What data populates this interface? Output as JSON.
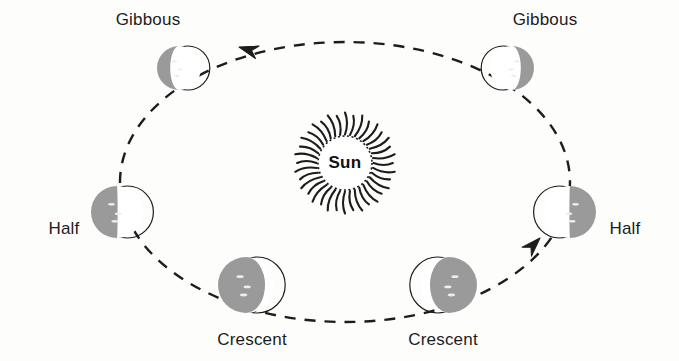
{
  "diagram": {
    "background_color": "#fdfdfc",
    "ink_color": "#1c1c1c",
    "shadow_color": "#9a9a9a",
    "lit_color": "#ffffff",
    "center_body": {
      "name": "Sun",
      "label": "Sun",
      "cx": 345,
      "cy": 163,
      "core_radius": 27,
      "ray_count": 36,
      "ray_length": 22
    },
    "orbit": {
      "cx": 345,
      "cy": 182,
      "rx": 225,
      "ry": 140,
      "style": "dashed",
      "dash": "11 9",
      "stroke_width": 2.4,
      "direction": "counterclockwise"
    },
    "arrows": [
      {
        "name": "orbit-arrow-top",
        "x": 239,
        "y": 47,
        "angle": 196,
        "description": "arrowhead pointing left along top of orbit"
      },
      {
        "name": "orbit-arrow-lower-right",
        "x": 540,
        "y": 238,
        "angle": -46,
        "description": "arrowhead pointing up-right toward right Half moon"
      }
    ],
    "moons": [
      {
        "id": "gibbous-left",
        "label": "Gibbous",
        "phase": "gibbous",
        "cx": 179,
        "cy": 68,
        "r": 22,
        "shadow_side": "left",
        "shadow_fraction": 0.3,
        "label_x": 148,
        "label_y": 25,
        "label_anchor": "middle"
      },
      {
        "id": "gibbous-right",
        "label": "Gibbous",
        "phase": "gibbous",
        "cx": 512,
        "cy": 68,
        "r": 22,
        "shadow_side": "right",
        "shadow_fraction": 0.3,
        "label_x": 545,
        "label_y": 25,
        "label_anchor": "middle"
      },
      {
        "id": "half-left",
        "label": "Half",
        "phase": "half",
        "cx": 117,
        "cy": 212,
        "r": 26,
        "shadow_side": "left",
        "shadow_fraction": 0.5,
        "label_x": 64,
        "label_y": 234,
        "label_anchor": "middle"
      },
      {
        "id": "half-right",
        "label": "Half",
        "phase": "half",
        "cx": 570,
        "cy": 212,
        "r": 26,
        "shadow_side": "right",
        "shadow_fraction": 0.5,
        "label_x": 625,
        "label_y": 234,
        "label_anchor": "middle"
      },
      {
        "id": "crescent-left",
        "label": "Crescent",
        "phase": "crescent",
        "cx": 246,
        "cy": 285,
        "r": 28,
        "shadow_side": "left",
        "shadow_fraction": 0.84,
        "label_x": 252,
        "label_y": 345,
        "label_anchor": "middle"
      },
      {
        "id": "crescent-right",
        "label": "Crescent",
        "phase": "crescent",
        "cx": 449,
        "cy": 285,
        "r": 28,
        "shadow_side": "right",
        "shadow_fraction": 0.84,
        "label_x": 443,
        "label_y": 345,
        "label_anchor": "middle"
      }
    ]
  }
}
